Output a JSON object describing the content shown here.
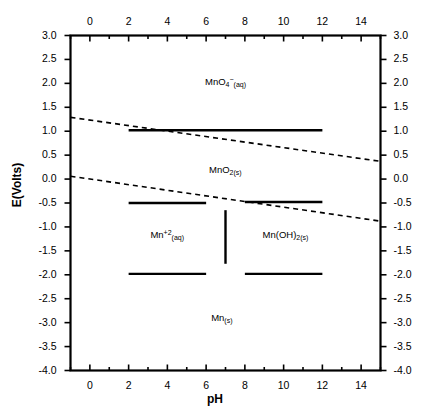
{
  "chart_data": {
    "type": "line",
    "title": "",
    "xlabel": "pH",
    "ylabel": "E(Volts)",
    "xlim": [
      -1,
      15
    ],
    "ylim": [
      -4.0,
      3.0
    ],
    "grid": false,
    "legend": "none",
    "x_ticks": [
      0,
      2,
      4,
      6,
      8,
      10,
      12,
      14
    ],
    "x_tick_labels": [
      "0",
      "2",
      "4",
      "6",
      "8",
      "10",
      "12",
      "14"
    ],
    "x_minor_ticks": [
      -1,
      1,
      3,
      5,
      7,
      9,
      11,
      13,
      15
    ],
    "y_ticks": [
      3.0,
      2.5,
      2.0,
      1.5,
      1.0,
      0.5,
      0.0,
      -0.5,
      -1.0,
      -1.5,
      -2.0,
      -2.5,
      -3.0,
      -3.5,
      -4.0
    ],
    "y_tick_labels": [
      "3.0",
      "2.5",
      "2.0",
      "1.5",
      "1.0",
      "0.5",
      "0.0",
      "-0.5",
      "-1.0",
      "-1.5",
      "-2.0",
      "-2.5",
      "-3.0",
      "-3.5",
      "-4.0"
    ],
    "x_axis_top": true,
    "x_axis_bottom": true,
    "y_axis_left": true,
    "y_axis_right": true,
    "series": [
      {
        "name": "MnO4-/MnO2 boundary",
        "style": "solid",
        "color": "#000000",
        "points": [
          [
            2.0,
            1.02
          ],
          [
            12.0,
            1.02
          ]
        ]
      },
      {
        "name": "MnO2/Mn+2 boundary",
        "style": "solid",
        "color": "#000000",
        "points": [
          [
            2.0,
            -0.5
          ],
          [
            6.0,
            -0.5
          ]
        ]
      },
      {
        "name": "MnO2/Mn(OH)2 boundary",
        "style": "solid",
        "color": "#000000",
        "points": [
          [
            8.0,
            -0.48
          ],
          [
            12.0,
            -0.48
          ]
        ]
      },
      {
        "name": "Mn+2/Mn(s) boundary",
        "style": "solid",
        "color": "#000000",
        "points": [
          [
            2.0,
            -1.98
          ],
          [
            6.0,
            -1.98
          ]
        ]
      },
      {
        "name": "Mn(OH)2/Mn(s) boundary",
        "style": "solid",
        "color": "#000000",
        "points": [
          [
            8.0,
            -1.98
          ],
          [
            12.0,
            -1.98
          ]
        ]
      },
      {
        "name": "Mn+2/Mn(OH)2 boundary",
        "style": "solid",
        "color": "#000000",
        "points": [
          [
            7.0,
            -0.65
          ],
          [
            7.0,
            -1.77
          ]
        ]
      },
      {
        "name": "water oxidation line",
        "style": "dashed",
        "color": "#000000",
        "points": [
          [
            -1.0,
            1.29
          ],
          [
            15.0,
            0.37
          ]
        ]
      },
      {
        "name": "water reduction line",
        "style": "dashed",
        "color": "#000000",
        "points": [
          [
            -1.0,
            0.06
          ],
          [
            15.0,
            -0.88
          ]
        ]
      }
    ],
    "annotations": [
      {
        "id": "mno4",
        "text_html": "MnO<sub>4</sub><sup>−</sup><sub>(aq)</sub>",
        "x": 7.0,
        "y": 2.0
      },
      {
        "id": "mno2",
        "text_html": "MnO<sub>2(s)</sub>",
        "x": 7.0,
        "y": 0.17
      },
      {
        "id": "mn2aq",
        "text_html": "Mn<sup>+2</sup><sub>(aq)</sub>",
        "x": 4.0,
        "y": -1.18
      },
      {
        "id": "mnoh2",
        "text_html": "Mn(OH)<sub>2(s)</sub>",
        "x": 10.1,
        "y": -1.18
      },
      {
        "id": "mns",
        "text_html": "Mn<sub>(s)</sub>",
        "x": 6.8,
        "y": -2.92
      }
    ]
  },
  "axes": {
    "x_title": "pH",
    "y_title": "E(Volts)"
  },
  "colors": {
    "foreground": "#000000",
    "background": "#ffffff"
  }
}
